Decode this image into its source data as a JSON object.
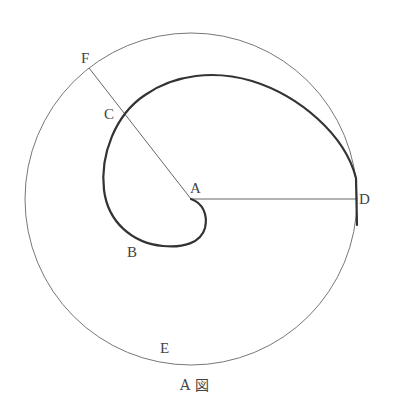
{
  "diagram": {
    "caption": "A 図",
    "labels": {
      "A": "A",
      "B": "B",
      "C": "C",
      "D": "D",
      "E": "E",
      "F": "F"
    },
    "colors": {
      "circle": "#777777",
      "spiral": "#333333",
      "lines": "#666666",
      "text": "#444444"
    },
    "geometry": {
      "circle_center": [
        191,
        199
      ],
      "circle_radius": 166,
      "point_A": [
        191,
        199
      ],
      "point_C": [
        124,
        117
      ],
      "point_D": [
        357,
        199
      ],
      "point_F": [
        89,
        68
      ]
    }
  }
}
